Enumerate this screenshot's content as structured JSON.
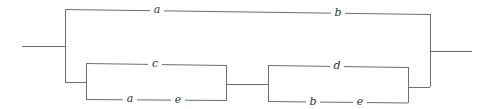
{
  "diagram": {
    "type": "series-parallel switching network",
    "line_color": "#6e6e6e",
    "label_color": "#333333",
    "top_branch": {
      "labels": [
        "a",
        "b"
      ]
    },
    "bottom_branch": {
      "left_block": {
        "upper_label": "c",
        "lower_labels": [
          "a",
          "e"
        ]
      },
      "right_block": {
        "upper_label": "d",
        "lower_labels": [
          "b",
          "e"
        ]
      }
    }
  }
}
